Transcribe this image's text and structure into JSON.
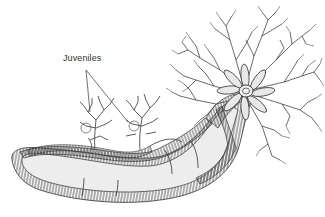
{
  "figure": {
    "labels": [
      {
        "id": "juveniles",
        "text": "Juveniles",
        "x": 63,
        "y": 53
      }
    ],
    "colors": {
      "background": "#ffffff",
      "ink": "#2b2b2b",
      "body_fill": "#ececec",
      "hatch": "#555555"
    }
  }
}
